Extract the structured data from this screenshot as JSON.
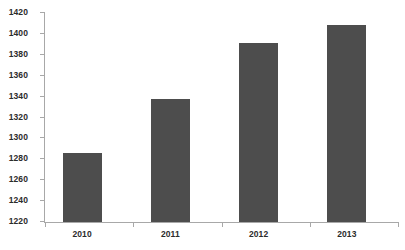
{
  "chart_data": {
    "type": "bar",
    "title": "",
    "subtitle": "",
    "xlabel": "",
    "ylabel": "",
    "categories": [
      "2010",
      "2011",
      "2012",
      "2013"
    ],
    "values": [
      1286,
      1338,
      1391,
      1409
    ],
    "series": [
      {
        "name": "",
        "values": [
          1286,
          1338,
          1391,
          1409
        ]
      }
    ],
    "ylim": [
      1220,
      1420
    ],
    "ytick_step": 20,
    "yticks": [
      1220,
      1240,
      1260,
      1280,
      1300,
      1320,
      1340,
      1360,
      1380,
      1400,
      1420
    ],
    "ytick_labels": [
      "1220",
      "1240",
      "1260",
      "1280",
      "1300",
      "1320",
      "1340",
      "1360",
      "1380",
      "1400",
      "1420"
    ],
    "grid": false,
    "legend": false,
    "legend_position": "none",
    "annotations": [],
    "colors": {
      "bar_fill": "#4d4d4d",
      "axis_line": "#a8a8a8",
      "tick_label": "#2b2b2b",
      "background": "#ffffff"
    }
  }
}
